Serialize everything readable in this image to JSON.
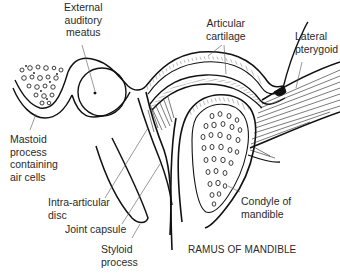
{
  "diagram": {
    "colors": {
      "line": "#111111",
      "label": "#2a2a2a",
      "background": "#ffffff"
    },
    "labels": {
      "external_auditory_meatus": [
        "External",
        "auditory",
        "meatus"
      ],
      "articular_cartilage": [
        "Articular",
        "cartilage"
      ],
      "lateral_pterygoid": [
        "Lateral",
        "pterygoid"
      ],
      "mastoid_process": [
        "Mastoid",
        "process",
        "containing",
        "air cells"
      ],
      "intra_articular_disc": [
        "Intra-articular",
        "disc"
      ],
      "joint_capsule": "Joint capsule",
      "condyle_of_mandible": [
        "Condyle of",
        "mandible"
      ],
      "styloid_process": [
        "Styloid",
        "process"
      ],
      "ramus_of_mandible": "RAMUS OF MANDIBLE"
    }
  }
}
